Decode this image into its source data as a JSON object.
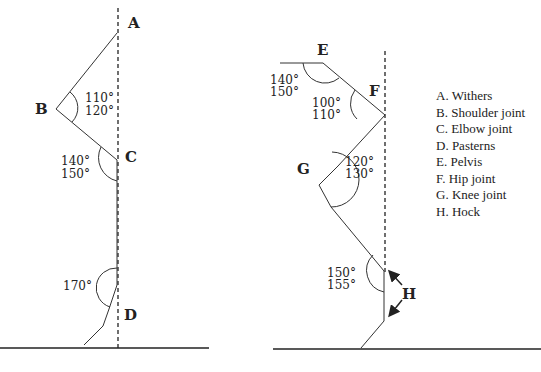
{
  "figure": {
    "forelimb": {
      "points": {
        "A": "A",
        "B": "B",
        "C": "C",
        "D": "D"
      },
      "angles": {
        "shoulder": [
          "110°",
          "120°"
        ],
        "elbow": [
          "140°",
          "150°"
        ],
        "fetlock": "170°"
      }
    },
    "hindlimb": {
      "points": {
        "E": "E",
        "F": "F",
        "G": "G",
        "H": "H"
      },
      "angles": {
        "pelvis": [
          "140°",
          "150°"
        ],
        "hip": [
          "100°",
          "110°"
        ],
        "knee": [
          "120°",
          "130°"
        ],
        "hock": [
          "150°",
          "155°"
        ]
      }
    },
    "legend": [
      "A. Withers",
      "B. Shoulder joint",
      "C. Elbow joint",
      "D. Pasterns",
      "E. Pelvis",
      "F. Hip joint",
      "G. Knee joint",
      "H. Hock"
    ]
  }
}
